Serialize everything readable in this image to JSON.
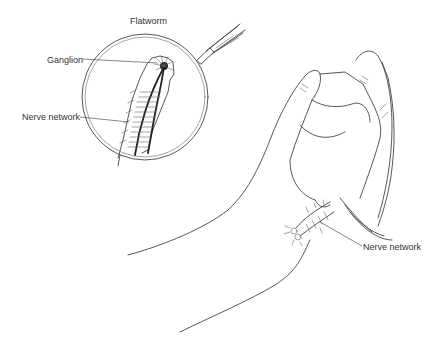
{
  "figure": {
    "type": "scientific-illustration",
    "inset": {
      "title": "Flatworm",
      "labels": [
        {
          "id": "ganglion",
          "text": "Ganglion"
        },
        {
          "id": "nerve_network_worm",
          "text": "Nerve network"
        }
      ]
    },
    "hand": {
      "labels": [
        {
          "id": "nerve_network_hand",
          "text": "Nerve network"
        }
      ]
    },
    "icons": [
      "magnifying-lens",
      "forceps",
      "flatworm",
      "hand"
    ],
    "colors": {
      "background": "#ffffff",
      "line": "#444444",
      "text": "#333333"
    }
  }
}
